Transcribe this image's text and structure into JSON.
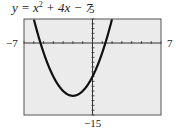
{
  "chart_data": {
    "type": "line",
    "function": {
      "a": 1,
      "b": 4,
      "c": -7
    },
    "xlim": [
      -7,
      7
    ],
    "ylim": [
      -15,
      5
    ],
    "xscale": 1,
    "yscale": 1,
    "grid": false,
    "labels": {
      "ymax": "5",
      "ymin": "−15",
      "xmin": "−7",
      "xmax": "7"
    },
    "key_points": {
      "vertex": [
        -2,
        -11
      ],
      "y_intercept": [
        0,
        -7
      ]
    }
  },
  "colors": {
    "background": "#ebebeb",
    "frame": "#555555",
    "curve": "#111111",
    "axis": "#333333"
  }
}
